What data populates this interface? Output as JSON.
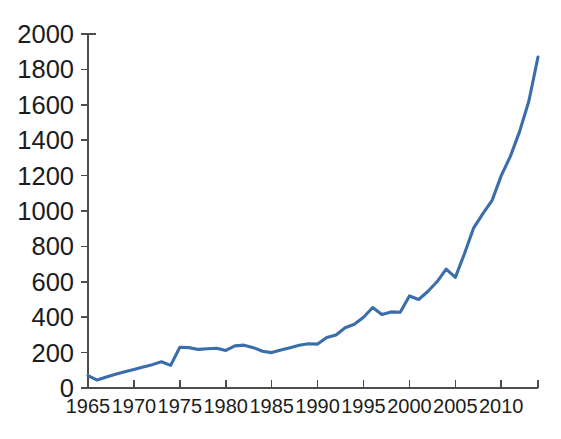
{
  "chart_data": {
    "type": "line",
    "title": "",
    "subtitle": "",
    "xlabel": "",
    "ylabel": "",
    "xlim": [
      1965,
      2014
    ],
    "ylim": [
      0,
      2000
    ],
    "grid": false,
    "legend": null,
    "legend_position": "none",
    "line_color": "#3a6eab",
    "axis_color": "#4d4d4d",
    "background_color": "#ffffff",
    "xticks": [
      1965,
      1970,
      1975,
      1980,
      1985,
      1990,
      1995,
      2000,
      2005,
      2010
    ],
    "xtick_labels": [
      "1965",
      "1970",
      "1975",
      "1980",
      "1985",
      "1990",
      "1995",
      "2000",
      "2005",
      "2010"
    ],
    "yticks": [
      0,
      200,
      400,
      600,
      800,
      1000,
      1200,
      1400,
      1600,
      1800,
      2000
    ],
    "ytick_labels": [
      "0",
      "200",
      "400",
      "600",
      "800",
      "1000",
      "1200",
      "1400",
      "1600",
      "1800",
      "2000"
    ],
    "series": [
      {
        "name": "value",
        "color": "#3a6eab",
        "x": [
          1965,
          1966,
          1967,
          1968,
          1969,
          1970,
          1971,
          1972,
          1973,
          1974,
          1975,
          1976,
          1977,
          1978,
          1979,
          1980,
          1981,
          1982,
          1983,
          1984,
          1985,
          1986,
          1987,
          1988,
          1989,
          1990,
          1991,
          1992,
          1993,
          1994,
          1995,
          1996,
          1997,
          1998,
          1999,
          2000,
          2001,
          2002,
          2003,
          2004,
          2005,
          2006,
          2007,
          2008,
          2009,
          2010,
          2011,
          2012,
          2013,
          2014
        ],
        "values": [
          70,
          45,
          62,
          78,
          92,
          105,
          118,
          132,
          148,
          128,
          230,
          228,
          218,
          222,
          225,
          212,
          238,
          242,
          228,
          208,
          200,
          215,
          228,
          242,
          250,
          248,
          285,
          300,
          340,
          360,
          400,
          455,
          415,
          430,
          428,
          520,
          500,
          545,
          600,
          672,
          625,
          760,
          905,
          985,
          1060,
          1200,
          1310,
          1450,
          1620,
          1870
        ]
      }
    ]
  },
  "geometry": {
    "plot_left": 88,
    "plot_right": 538,
    "plot_bottom": 388,
    "plot_top": 34
  }
}
